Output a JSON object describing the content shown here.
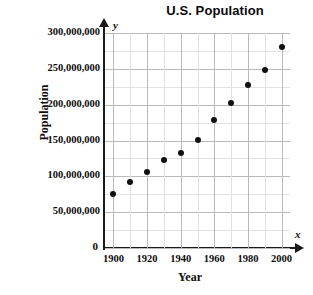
{
  "chart_data": {
    "type": "scatter",
    "title": "U.S. Population",
    "xlabel": "Year",
    "ylabel": "Population",
    "x_axis_variable": "x",
    "y_axis_variable": "y",
    "xlim": [
      1895,
      2005
    ],
    "ylim": [
      0,
      300000000
    ],
    "grid": true,
    "x_gridline_step": 10,
    "y_gridline_step": 25000000,
    "legend": "none",
    "x_tick_labels": [
      "1900",
      "1920",
      "1940",
      "1960",
      "1980",
      "2000"
    ],
    "x_tick_values": [
      1900,
      1920,
      1940,
      1960,
      1980,
      2000
    ],
    "y_tick_labels": [
      "0",
      "50,000,000",
      "100,000,000",
      "150,000,000",
      "200,000,000",
      "250,000,000",
      "300,000,000"
    ],
    "y_tick_values": [
      0,
      50000000,
      100000000,
      150000000,
      200000000,
      250000000,
      300000000
    ],
    "x": [
      1900,
      1910,
      1920,
      1930,
      1940,
      1950,
      1960,
      1970,
      1980,
      1990,
      2000
    ],
    "values": [
      76000000,
      92000000,
      106000000,
      123000000,
      132000000,
      151000000,
      179000000,
      203000000,
      227000000,
      249000000,
      281000000
    ],
    "points": [
      {
        "year": 1900,
        "population": 76000000
      },
      {
        "year": 1910,
        "population": 92000000
      },
      {
        "year": 1920,
        "population": 106000000
      },
      {
        "year": 1930,
        "population": 123000000
      },
      {
        "year": 1940,
        "population": 132000000
      },
      {
        "year": 1950,
        "population": 151000000
      },
      {
        "year": 1960,
        "population": 179000000
      },
      {
        "year": 1970,
        "population": 203000000
      },
      {
        "year": 1980,
        "population": 227000000
      },
      {
        "year": 1990,
        "population": 249000000
      },
      {
        "year": 2000,
        "population": 281000000
      }
    ]
  }
}
